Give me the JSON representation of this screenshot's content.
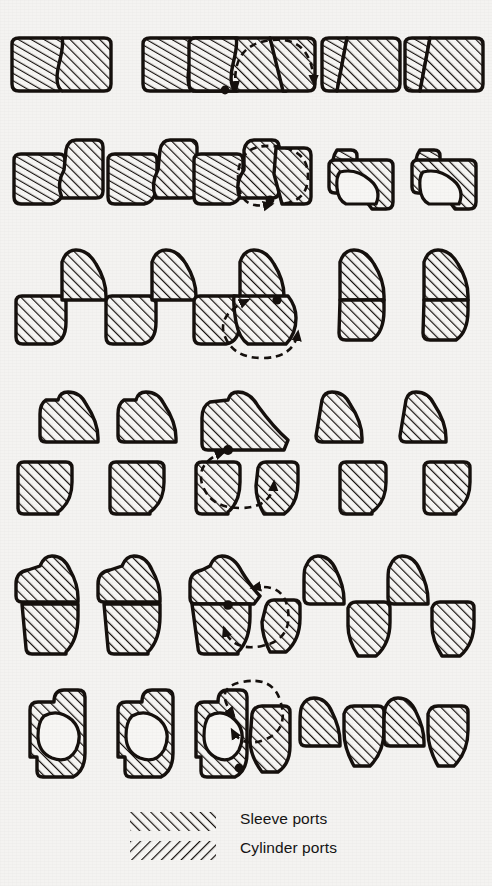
{
  "figure": {
    "background_color": "#f4f3f1",
    "ink_color": "#111111",
    "rows": 7,
    "columns": 5
  },
  "legend": {
    "items": [
      {
        "id": "sleeve-ports",
        "label": "Sleeve ports",
        "hatch": "forward",
        "hatch_symbol": "/////////",
        "color": "#141414"
      },
      {
        "id": "cylinder-ports",
        "label": "Cylinder ports",
        "hatch": "backward",
        "hatch_symbol": "\\\\\\\\\\\\\\\\\\",
        "color": "#141414"
      }
    ]
  },
  "rotation_indicator": {
    "name": "rotation-arrow",
    "style": "dashed-arc-with-arrowheads",
    "pivot_marker": "filled-dot",
    "present_in_column": 3,
    "description": "Dashed circular arrow showing sleeve rotation about the pivot point"
  },
  "diagram_rows": [
    {
      "id": "row-1",
      "label": "Ports fully overlapped",
      "y": 40,
      "cells": [
        {
          "col": 1,
          "x": 38,
          "variant": "pair-closed",
          "rotation": false
        },
        {
          "col": 2,
          "x": 168,
          "variant": "pair-closed",
          "rotation": false
        },
        {
          "col": 3,
          "x": 286,
          "variant": "pair-rotating",
          "rotation": true
        },
        {
          "col": 4,
          "x": 368,
          "variant": "pair-narrow",
          "rotation": false
        },
        {
          "col": 5,
          "x": 452,
          "variant": "pair-narrow",
          "rotation": false
        }
      ]
    },
    {
      "id": "row-2",
      "label": "Ports beginning to open",
      "y": 148,
      "cells": [
        {
          "col": 1,
          "x": 38,
          "variant": "offset-pair",
          "rotation": false
        },
        {
          "col": 2,
          "x": 168,
          "variant": "offset-pair",
          "rotation": false
        },
        {
          "col": 3,
          "x": 286,
          "variant": "offset-rotating",
          "rotation": true
        },
        {
          "col": 4,
          "x": 368,
          "variant": "open-port",
          "rotation": false
        },
        {
          "col": 5,
          "x": 452,
          "variant": "open-port",
          "rotation": false
        }
      ]
    },
    {
      "id": "row-3",
      "label": "Ports at mid travel",
      "y": 258,
      "cells": [
        {
          "col": 1,
          "x": 38,
          "variant": "diagonal-pair",
          "rotation": false
        },
        {
          "col": 2,
          "x": 168,
          "variant": "diagonal-pair",
          "rotation": false
        },
        {
          "col": 3,
          "x": 286,
          "variant": "diagonal-rotating",
          "rotation": true
        },
        {
          "col": 4,
          "x": 368,
          "variant": "stacked-pair",
          "rotation": false
        },
        {
          "col": 5,
          "x": 452,
          "variant": "stacked-pair",
          "rotation": false
        }
      ]
    },
    {
      "id": "row-4",
      "label": "Upper members separated",
      "y": 392,
      "cells": [
        {
          "col": 1,
          "x": 38,
          "variant": "upper-block",
          "rotation": false
        },
        {
          "col": 2,
          "x": 168,
          "variant": "upper-block",
          "rotation": false
        },
        {
          "col": 3,
          "x": 286,
          "variant": "upper-merged",
          "rotation": true
        },
        {
          "col": 4,
          "x": 368,
          "variant": "upper-block",
          "rotation": false
        },
        {
          "col": 5,
          "x": 452,
          "variant": "upper-block",
          "rotation": false
        }
      ]
    },
    {
      "id": "row-5",
      "label": "Lower members separated",
      "y": 462,
      "cells": [
        {
          "col": 1,
          "x": 38,
          "variant": "lower-block",
          "rotation": false
        },
        {
          "col": 2,
          "x": 168,
          "variant": "lower-block",
          "rotation": false
        },
        {
          "col": 3,
          "x": 286,
          "variant": "lower-split",
          "rotation": true
        },
        {
          "col": 4,
          "x": 368,
          "variant": "lower-block",
          "rotation": false
        },
        {
          "col": 5,
          "x": 452,
          "variant": "lower-block",
          "rotation": false
        }
      ]
    },
    {
      "id": "row-6",
      "label": "Ports closing",
      "y": 556,
      "cells": [
        {
          "col": 1,
          "x": 38,
          "variant": "tall-stacked",
          "rotation": false
        },
        {
          "col": 2,
          "x": 168,
          "variant": "tall-stacked",
          "rotation": false
        },
        {
          "col": 3,
          "x": 286,
          "variant": "tall-rotating",
          "rotation": true
        },
        {
          "col": 4,
          "x": 368,
          "variant": "split-offset",
          "rotation": false
        },
        {
          "col": 5,
          "x": 452,
          "variant": "split-offset",
          "rotation": false
        }
      ]
    },
    {
      "id": "row-7",
      "label": "Ports fully closed",
      "y": 688,
      "cells": [
        {
          "col": 1,
          "x": 38,
          "variant": "ring-closed",
          "rotation": false
        },
        {
          "col": 2,
          "x": 168,
          "variant": "ring-closed",
          "rotation": false
        },
        {
          "col": 3,
          "x": 286,
          "variant": "ring-rotating",
          "rotation": true
        },
        {
          "col": 4,
          "x": 368,
          "variant": "split-offset",
          "rotation": false
        },
        {
          "col": 5,
          "x": 452,
          "variant": "split-offset",
          "rotation": false
        }
      ]
    }
  ]
}
